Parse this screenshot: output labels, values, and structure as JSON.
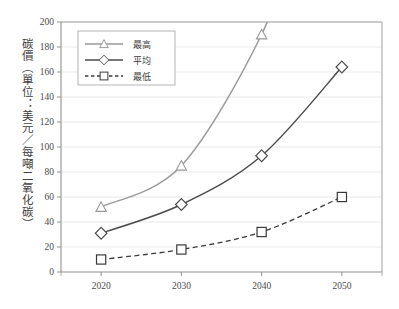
{
  "chart_data": {
    "type": "line",
    "title": "",
    "xlabel": "",
    "ylabel": "碳價（單位：美元／每噸二氧化碳）",
    "categories": [
      "2020",
      "2030",
      "2040",
      "2050"
    ],
    "x": [
      2020,
      2030,
      2040,
      2050
    ],
    "xlim": [
      2015,
      2055
    ],
    "ylim": [
      0,
      200
    ],
    "ytick_labels": [
      "0",
      "20",
      "40",
      "60",
      "80",
      "100",
      "120",
      "140",
      "160",
      "180",
      "200"
    ],
    "ytick_values": [
      0,
      20,
      40,
      60,
      80,
      100,
      120,
      140,
      160,
      180,
      200
    ],
    "grid": true,
    "grid_axis": "y",
    "legend_position": "top-left-inside",
    "series": [
      {
        "name": "最高",
        "marker": "triangle",
        "line_style": "solid",
        "color": "#9a9a9a",
        "values": [
          52,
          85,
          190,
          null
        ],
        "clipped_above_ylim": true
      },
      {
        "name": "平均",
        "marker": "diamond",
        "line_style": "solid",
        "color": "#4d4d4d",
        "values": [
          31,
          54,
          93,
          164
        ]
      },
      {
        "name": "最低",
        "marker": "square",
        "line_style": "dashed",
        "color": "#3a3a3a",
        "values": [
          10,
          18,
          32,
          60
        ]
      }
    ]
  },
  "legend": {
    "items": [
      {
        "label": "最高",
        "marker": "triangle-icon",
        "line_style": "solid",
        "color": "#9a9a9a"
      },
      {
        "label": "平均",
        "marker": "diamond-icon",
        "line_style": "solid",
        "color": "#4d4d4d"
      },
      {
        "label": "最低",
        "marker": "square-icon",
        "line_style": "dashed",
        "color": "#3a3a3a"
      }
    ]
  },
  "axes": {
    "y_axis_label": "碳價（單位：美元／每噸二氧化碳）",
    "y_ticks": [
      "200",
      "180",
      "160",
      "140",
      "120",
      "100",
      "80",
      "60",
      "40",
      "20",
      "0"
    ],
    "x_ticks": [
      "2020",
      "2030",
      "2040",
      "2050"
    ]
  },
  "colors": {
    "background": "#ffffff",
    "plot_border": "#9b9b9b",
    "gridline": "#e3e3e3",
    "axis_text": "#4a4a4a",
    "series_high": "#9a9a9a",
    "series_avg": "#4d4d4d",
    "series_low": "#3a3a3a"
  }
}
